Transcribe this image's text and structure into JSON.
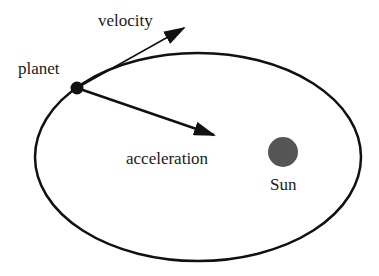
{
  "diagram": {
    "labels": {
      "velocity": "velocity",
      "planet": "planet",
      "acceleration": "acceleration",
      "sun": "Sun"
    },
    "colors": {
      "orbit": "#111111",
      "planet": "#111111",
      "sun": "#555555",
      "text": "#1a1a1a"
    }
  }
}
